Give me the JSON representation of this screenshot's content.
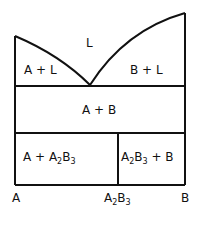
{
  "diagram": {
    "type": "binary phase diagram with congruent compound",
    "regions": {
      "liquid": "L",
      "a_plus_liquid": "A + L",
      "b_plus_liquid": "B + L",
      "a_plus_b": "A + B",
      "a_plus_compound_prefix": "A + A",
      "a_plus_compound_sub1": "2",
      "a_plus_compound_mid": "B",
      "a_plus_compound_sub2": "3",
      "compound_plus_b_prefix": "A",
      "compound_plus_b_sub1": "2",
      "compound_plus_b_mid": "B",
      "compound_plus_b_sub2": "3",
      "compound_plus_b_suffix": " + B"
    },
    "axis": {
      "left": "A",
      "middle_prefix": "A",
      "middle_sub1": "2",
      "middle_mid": "B",
      "middle_sub2": "3",
      "right": "B"
    },
    "line_color": "#111111"
  }
}
